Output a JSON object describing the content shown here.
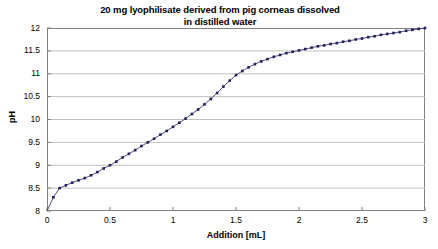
{
  "chart_data": {
    "type": "line",
    "title": "20 mg lyophilisate derived from pig corneas dissolved in distilled water",
    "title_lines": [
      "20 mg lyophilisate derived from pig corneas dissolved",
      "in distilled water"
    ],
    "xlabel": "Addition [mL]",
    "ylabel": "pH",
    "xlim": [
      0,
      3
    ],
    "ylim": [
      8,
      12
    ],
    "xticks": [
      0,
      0.5,
      1,
      1.5,
      2,
      2.5,
      3
    ],
    "xtick_labels": [
      "0",
      "0.5",
      "1",
      "1.5",
      "2",
      "2.5",
      "3"
    ],
    "yticks": [
      8,
      8.5,
      9,
      9.5,
      10,
      10.5,
      11,
      11.5,
      12
    ],
    "ytick_labels": [
      "8",
      "8.5",
      "9",
      "9.5",
      "10",
      "10.5",
      "11",
      "11.5",
      "12"
    ],
    "grid": "horizontal",
    "grid_color": "#c0c0c0",
    "frame_color": "#808080",
    "legend": "none",
    "series": [
      {
        "name": "pH titration curve",
        "marker": "square",
        "marker_color": "#1f1f5c",
        "line_color": "#3b3b6d",
        "x": [
          0,
          0.05,
          0.1,
          0.15,
          0.2,
          0.25,
          0.3,
          0.35,
          0.4,
          0.45,
          0.5,
          0.55,
          0.6,
          0.65,
          0.7,
          0.75,
          0.8,
          0.85,
          0.9,
          0.95,
          1.0,
          1.05,
          1.1,
          1.15,
          1.2,
          1.25,
          1.3,
          1.35,
          1.4,
          1.45,
          1.5,
          1.55,
          1.6,
          1.65,
          1.7,
          1.75,
          1.8,
          1.85,
          1.9,
          1.95,
          2.0,
          2.05,
          2.1,
          2.15,
          2.2,
          2.25,
          2.3,
          2.35,
          2.4,
          2.45,
          2.5,
          2.55,
          2.6,
          2.65,
          2.7,
          2.75,
          2.8,
          2.85,
          2.9,
          2.95,
          3.0
        ],
        "y": [
          8.0,
          8.3,
          8.5,
          8.56,
          8.62,
          8.67,
          8.72,
          8.78,
          8.85,
          8.93,
          9.0,
          9.08,
          9.17,
          9.25,
          9.33,
          9.42,
          9.5,
          9.58,
          9.67,
          9.75,
          9.84,
          9.93,
          10.02,
          10.12,
          10.22,
          10.33,
          10.45,
          10.58,
          10.72,
          10.85,
          10.97,
          11.06,
          11.14,
          11.21,
          11.27,
          11.32,
          11.37,
          11.41,
          11.45,
          11.48,
          11.51,
          11.54,
          11.57,
          11.6,
          11.62,
          11.65,
          11.67,
          11.7,
          11.72,
          11.75,
          11.77,
          11.8,
          11.82,
          11.85,
          11.87,
          11.89,
          11.91,
          11.94,
          11.96,
          11.98,
          12.0
        ]
      }
    ]
  }
}
